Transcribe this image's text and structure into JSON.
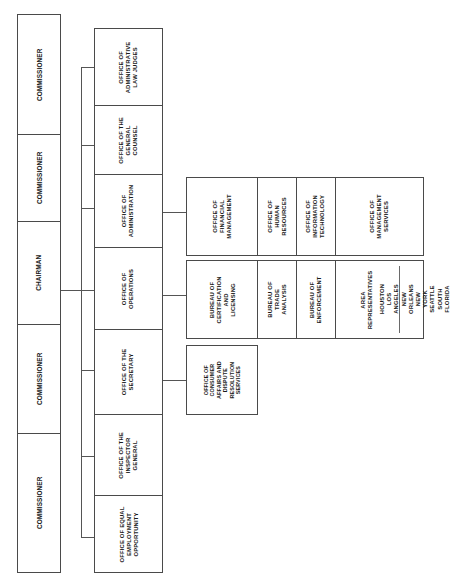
{
  "chart": {
    "orientation": "rotated-90",
    "colors": {
      "border": "#4a4a4a",
      "line": "#555555",
      "text": "#1a1a1a",
      "background": "#ffffff"
    }
  },
  "commission": {
    "members": [
      {
        "label": "COMMISSIONER"
      },
      {
        "label": "COMMISSIONER"
      },
      {
        "label": "CHAIRMAN"
      },
      {
        "label": "COMMISSIONER"
      },
      {
        "label": "COMMISSIONER"
      }
    ]
  },
  "offices": [
    {
      "label": "OFFICE OF\nADMINISTRATIVE\nLAW JUDGES"
    },
    {
      "label": "OFFICE OF THE\nGENERAL\nCOUNSEL"
    },
    {
      "label": "OFFICE OF\nADMINISTRATION"
    },
    {
      "label": "OFFICE OF\nOPERATIONS"
    },
    {
      "label": "OFFICE OF THE\nSECRETARY"
    },
    {
      "label": "OFFICE OF THE\nINSPECTOR\nGENERAL"
    },
    {
      "label": "OFFICE OF EQUAL\nEMPLOYMENT\nOPPORTUNITY"
    }
  ],
  "administration_units": [
    {
      "label": "OFFICE OF\nFINANCIAL\nMANAGEMENT"
    },
    {
      "label": "OFFICE OF\nHUMAN\nRESOURCES"
    },
    {
      "label": "OFFICE OF\nINFORMATION\nTECHNOLOGY"
    },
    {
      "label": "OFFICE OF\nMANAGEMENT\nSERVICES"
    }
  ],
  "operations_units": [
    {
      "label": "BUREAU OF\nCERTIFICATION\nAND\nLICENSING"
    },
    {
      "label": "BUREAU OF\nTRADE\nANALYSIS"
    },
    {
      "label": "BUREAU OF\nENFORCEMENT"
    }
  ],
  "area_representatives": {
    "label": "AREA\nREPRESENTATIVES",
    "cities": "HOUSTON\nLOS ANGELES\nNEW ORLEANS\nNEW YORK\nSEATTLE\nSOUTH FLORIDA"
  },
  "secretary_units": [
    {
      "label": "OFFICE OF\nCONSUMER\nAFFAIRS AND\nDISPUTE\nRESOLUTION\nSERVICES"
    }
  ]
}
